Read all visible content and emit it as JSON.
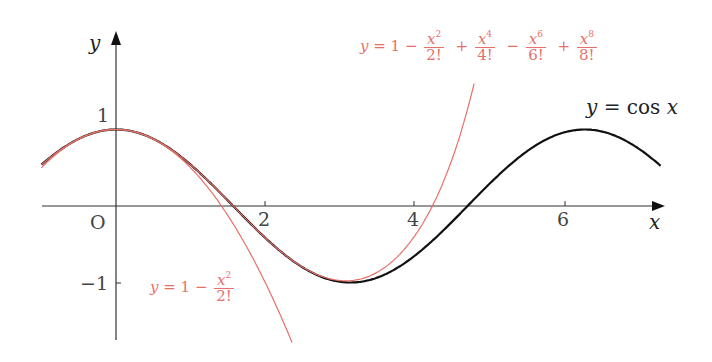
{
  "chart_data": {
    "type": "line",
    "title": "",
    "xlabel": "x",
    "ylabel": "y",
    "origin_label": "O",
    "xlim": [
      -1,
      7.3
    ],
    "ylim": [
      -1.8,
      2.3
    ],
    "grid": false,
    "x_ticks": [
      {
        "value": 2,
        "label": "2"
      },
      {
        "value": 4,
        "label": "4"
      },
      {
        "value": 6,
        "label": "6"
      }
    ],
    "y_ticks": [
      {
        "value": 1,
        "label": "1"
      },
      {
        "value": -1,
        "label": "−1"
      }
    ],
    "series": [
      {
        "name": "y = cos x",
        "function": "cos(x)",
        "domain": [
          -1,
          7.3
        ],
        "color": "#111111",
        "width": 2.2
      },
      {
        "name": "y = 1 − x²/2!",
        "function": "1 - x^2/2",
        "domain": [
          -1,
          2.4
        ],
        "color": "#e8706a",
        "width": 1.2
      },
      {
        "name": "y = 1 − x²/2! + x⁴/4! − x⁶/6! + x⁸/8!",
        "function": "1 - x^2/2 + x^4/24 - x^6/720 + x^8/40320",
        "domain": [
          -1,
          4.8
        ],
        "color": "#e8706a",
        "width": 1.2
      }
    ]
  },
  "labels": {
    "y_axis": "y",
    "x_axis": "x",
    "origin": "O",
    "tick_1": "1",
    "tick_neg1": "−1",
    "tick_2": "2",
    "tick_4": "4",
    "tick_6": "6",
    "cos": {
      "lhs": "y",
      "eq": " = cos ",
      "var": "x"
    },
    "taylor2": {
      "lhs": "y",
      "eq": " = 1 − ",
      "num": "x",
      "exp": "2",
      "den": "2!"
    },
    "taylor8": {
      "lhs": "y",
      "eq": " = 1 − ",
      "t1": {
        "num": "x",
        "exp": "2",
        "den": "2!"
      },
      "op1": "+",
      "t2": {
        "num": "x",
        "exp": "4",
        "den": "4!"
      },
      "op2": "−",
      "t3": {
        "num": "x",
        "exp": "6",
        "den": "6!"
      },
      "op3": "+",
      "t4": {
        "num": "x",
        "exp": "8",
        "den": "8!"
      }
    }
  }
}
